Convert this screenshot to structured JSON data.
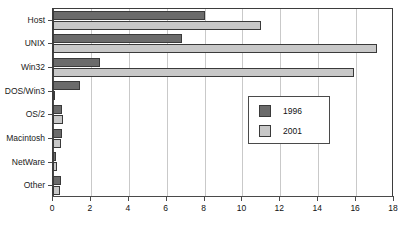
{
  "chart_data": {
    "type": "bar",
    "orientation": "horizontal",
    "title": "",
    "subtitle": "",
    "xlabel": "",
    "ylabel": "",
    "xlim": [
      0,
      18
    ],
    "xticks": [
      0,
      2,
      4,
      6,
      8,
      10,
      12,
      14,
      16,
      18
    ],
    "grid": "vertical",
    "legend_position": "middle-right",
    "categories": [
      "Host",
      "UNIX",
      "Win32",
      "DOS/Win3",
      "OS/2",
      "Macintosh",
      "NetWare",
      "Other"
    ],
    "series": [
      {
        "name": "1996",
        "color": "#6b6b6b",
        "values": [
          8.0,
          6.8,
          2.5,
          1.4,
          0.45,
          0.45,
          0.15,
          0.4
        ]
      },
      {
        "name": "2001",
        "color": "#c8c8c8",
        "values": [
          11.0,
          17.1,
          15.9,
          0.05,
          0.55,
          0.4,
          0.2,
          0.35
        ]
      }
    ]
  },
  "legend": {
    "entries": [
      {
        "label": "1996",
        "swatch": "legend-swatch-1996"
      },
      {
        "label": "2001",
        "swatch": "legend-swatch-2001"
      }
    ]
  },
  "colors": {
    "series_1996": "#6b6b6b",
    "series_2001": "#c8c8c8",
    "axis": "#4a4a4a",
    "grid": "#c9c9c9",
    "background": "#ffffff"
  }
}
